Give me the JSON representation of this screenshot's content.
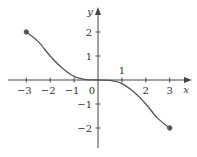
{
  "chart_data": {
    "type": "line",
    "title": "",
    "xlabel": "x",
    "ylabel": "y",
    "xlim": [
      -3.5,
      3.5
    ],
    "ylim": [
      -2.5,
      2.5
    ],
    "grid": false,
    "x_ticks": [
      -3,
      -2,
      -1,
      1,
      2,
      3
    ],
    "x_tick_labels": [
      "−3",
      "−2",
      "−1",
      "1",
      "2",
      "3"
    ],
    "y_ticks": [
      2,
      1,
      -1,
      -2
    ],
    "y_tick_labels": [
      "2",
      "1",
      "−1",
      "−2"
    ],
    "origin_label": "0",
    "series": [
      {
        "name": "f(x)",
        "x": [
          -3,
          -2.5,
          -2,
          -1.5,
          -1,
          -0.5,
          0,
          0.5,
          1,
          1.5,
          2,
          2.5,
          3
        ],
        "values": [
          2,
          1.6,
          1.0,
          0.5,
          0.15,
          0.02,
          0,
          -0.02,
          -0.15,
          -0.5,
          -1.0,
          -1.6,
          -2
        ]
      }
    ],
    "endpoints": [
      {
        "x": -3,
        "y": 2,
        "filled": true
      },
      {
        "x": 3,
        "y": -2,
        "filled": true
      }
    ]
  },
  "colors": {
    "curve": "#555555",
    "axis": "#444444",
    "text": "#333333"
  }
}
